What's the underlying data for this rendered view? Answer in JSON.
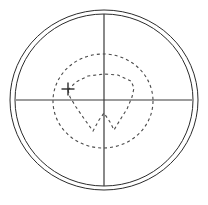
{
  "figure": {
    "background_color": "#ffffff",
    "line_color": "#2b2b2b",
    "dashed_color": "#4a4a4a",
    "width": 208,
    "height": 205
  },
  "chart_data": {
    "type": "scatter",
    "title": "",
    "xlabel": "",
    "ylabel": "",
    "grid": false,
    "legend": "none",
    "center": {
      "x": 104,
      "y": 100
    },
    "elements": [
      {
        "name": "outer-boundary-circle",
        "shape": "circle",
        "style": "solid",
        "cx": 104,
        "cy": 100,
        "rx": 94,
        "ry": 90
      },
      {
        "name": "inner-boundary-circle",
        "shape": "circle",
        "style": "solid",
        "cx": 104,
        "cy": 100,
        "rx": 89,
        "ry": 86
      },
      {
        "name": "isopter-dashed-circle",
        "shape": "circle",
        "style": "dashed",
        "cx": 103,
        "cy": 101,
        "rx": 50,
        "ry": 47
      },
      {
        "name": "inner-isopter-polygon",
        "shape": "polygon",
        "style": "dashed",
        "points": "68,90 76,82 88,76 104,74 118,75 131,81 134,88 132,97 127,109 120,120 114,130 110,122 104,113 99,120 93,131 85,120 76,107 70,97 68,90"
      },
      {
        "name": "blind-spot-marker",
        "shape": "plus",
        "style": "solid",
        "cx": 68,
        "cy": 89,
        "size": 13
      },
      {
        "name": "vertical-axis",
        "shape": "line",
        "style": "solid",
        "x1": 104,
        "y1": 14,
        "x2": 104,
        "y2": 186
      },
      {
        "name": "horizontal-axis",
        "shape": "line",
        "style": "solid",
        "x1": 16,
        "y1": 100,
        "x2": 192,
        "y2": 100
      }
    ],
    "axis_ranges": {
      "x": [
        -94,
        94
      ],
      "y": [
        -90,
        90
      ]
    }
  }
}
